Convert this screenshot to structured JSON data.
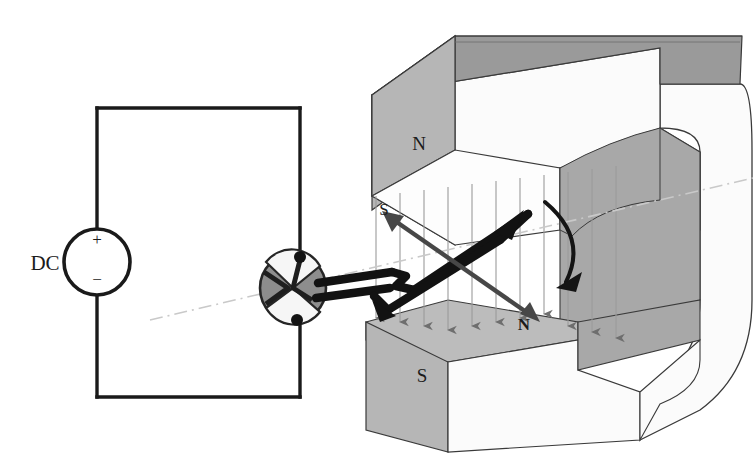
{
  "figure": {
    "type": "diagram",
    "background": "#ffffff"
  },
  "circuit": {
    "source_label": "DC",
    "terminal_positive": "+",
    "terminal_negative": "−",
    "wire_color": "#1a1a1a",
    "loop": {
      "left": 97,
      "right": 300,
      "top": 108,
      "bottom": 397
    },
    "source_circle": {
      "cx": 97,
      "cy": 262,
      "r": 33
    }
  },
  "commutator": {
    "name": "split-ring-commutator",
    "cx": 293,
    "cy": 288,
    "rx": 33,
    "ry": 34,
    "fill": "#8e8e8e",
    "edge": "#2a2a2a"
  },
  "magnet": {
    "name": "c-shaped-permanent-magnet",
    "upper_pole_label": "N",
    "lower_pole_label": "S",
    "face_fill": "#b6b6b6",
    "top_fill": "#9a9a9a",
    "side_fill": "#fbfbfb",
    "inner_fill": "#a8a8a8",
    "outline": "#3a3a3a"
  },
  "coil": {
    "name": "current-carrying-loop",
    "normal_label_far": "S",
    "normal_label_near": "N",
    "wire_color": "#121212"
  },
  "field": {
    "name": "magnetic-field-lines",
    "direction": "downward",
    "arrow_color": "#6e6e6e",
    "line_color": "#9b9b9b",
    "count": 11
  },
  "axis": {
    "name": "rotation-axis",
    "style": "dash-dot",
    "color": "#c9c9c9"
  },
  "rotation": {
    "name": "rotation-direction-arrow",
    "color": "#141414"
  }
}
